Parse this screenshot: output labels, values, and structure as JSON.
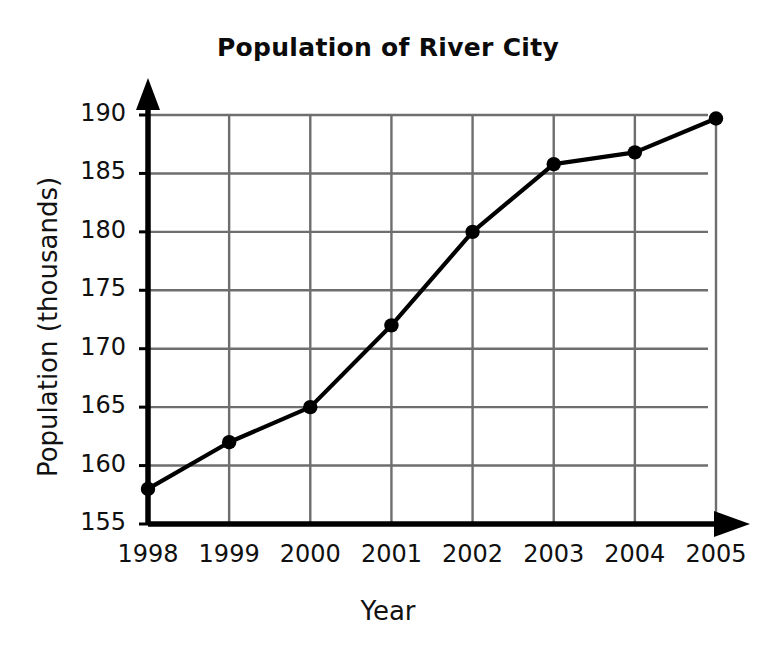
{
  "chart_data": {
    "type": "line",
    "title": "Population of River City",
    "xlabel": "Year",
    "ylabel": "Population (thousands)",
    "categories": [
      "1998",
      "1999",
      "2000",
      "2001",
      "2002",
      "2003",
      "2004",
      "2005"
    ],
    "x": [
      1998,
      1999,
      2000,
      2001,
      2002,
      2003,
      2004,
      2005
    ],
    "values": [
      158,
      162,
      165,
      172,
      180,
      185.8,
      186.8,
      189.7
    ],
    "series": [
      {
        "name": "Population",
        "values": [
          158,
          162,
          165,
          172,
          180,
          185.8,
          186.8,
          189.7
        ]
      }
    ],
    "ylim": [
      155,
      190
    ],
    "xlim": [
      1998,
      2005
    ],
    "yticks": [
      155,
      160,
      165,
      170,
      175,
      180,
      185,
      190
    ],
    "ytick_labels": [
      "155",
      "160",
      "165",
      "170",
      "175",
      "180",
      "185",
      "190"
    ],
    "xticks": [
      1998,
      1999,
      2000,
      2001,
      2002,
      2003,
      2004,
      2005
    ],
    "xtick_labels": [
      "1998",
      "1999",
      "2000",
      "2001",
      "2002",
      "2003",
      "2004",
      "2005"
    ],
    "grid": true,
    "legend": false,
    "marker": "filled-circle",
    "line_color": "#000000",
    "marker_color": "#000000",
    "grid_color": "#6e6e6e",
    "axis_color": "#000000",
    "background_color": "#ffffff",
    "axis_arrows": true
  }
}
